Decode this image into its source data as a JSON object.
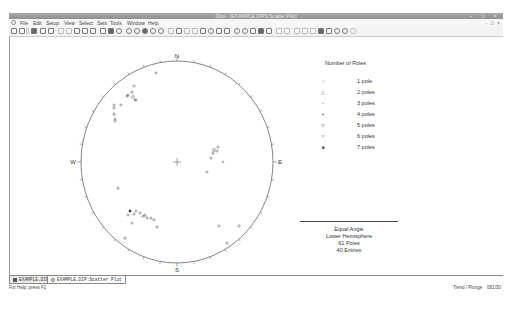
{
  "window": {
    "title": "Dips - [EXAMPLE.DIPS:Scatter Plot]",
    "controls": [
      "minimize",
      "maximize",
      "close"
    ]
  },
  "menubar": {
    "items": [
      "File",
      "Edit",
      "Setup",
      "View",
      "Select",
      "Sets",
      "Tools",
      "Window",
      "Help"
    ]
  },
  "toolbar": {
    "buttons": [
      "new-icon",
      "open-icon",
      "dropdown-icon",
      "save-icon",
      "print-preview-icon",
      "print-icon",
      "undo-icon",
      "redo-icon",
      "copy-icon",
      "paste-icon",
      "export-icon",
      "pole-plot-icon",
      "scatter-plot-icon",
      "contour-plot-icon",
      "stereonet-1-icon",
      "stereonet-2-icon",
      "stereonet-3-icon",
      "stereonet-4-icon",
      "stereonet-5-icon",
      "add-plane-icon",
      "add-set-icon",
      "add-line-icon",
      "edit-icon",
      "circle-icon",
      "cone-icon",
      "cone-2-icon",
      "set-window-icon",
      "intersection-icon",
      "kinematic-icon",
      "rosette-icon",
      "arrow-icon",
      "chart-icon",
      "filter-icon",
      "query-icon",
      "measure-icon",
      "grid-icon",
      "zoom-icon",
      "zoom-extents-icon",
      "rotate-icon",
      "pan-icon",
      "info-icon",
      "help-icon"
    ]
  },
  "plot": {
    "compass": {
      "north": "N",
      "south": "S",
      "east": "E",
      "west": "W"
    },
    "center_marker": "+"
  },
  "chart_data": {
    "type": "scatter",
    "projection": "Equal Angle",
    "hemisphere": "Lower Hemisphere",
    "legend_title": "Number of Poles",
    "legend": [
      {
        "label": "1 pole",
        "symbol": "○"
      },
      {
        "label": "2 poles",
        "symbol": "△"
      },
      {
        "label": "3 poles",
        "symbol": "▫"
      },
      {
        "label": "4 poles",
        "symbol": "+"
      },
      {
        "label": "5 poles",
        "symbol": "◇"
      },
      {
        "label": "6 poles",
        "symbol": "▿"
      },
      {
        "label": "7 poles",
        "symbol": "■"
      }
    ],
    "points_px": [
      [
        155,
        73,
        1
      ],
      [
        133,
        86,
        1
      ],
      [
        131,
        92,
        2
      ],
      [
        127,
        95,
        2
      ],
      [
        134,
        100,
        4
      ],
      [
        126,
        96,
        1
      ],
      [
        132,
        97,
        3
      ],
      [
        135,
        100,
        1
      ],
      [
        113,
        105,
        1
      ],
      [
        120,
        105,
        1
      ],
      [
        113,
        108,
        1
      ],
      [
        113,
        114,
        2
      ],
      [
        114,
        119,
        1
      ],
      [
        114,
        121,
        1
      ],
      [
        217,
        147,
        1
      ],
      [
        213,
        150,
        3
      ],
      [
        216,
        151,
        1
      ],
      [
        212,
        153,
        2
      ],
      [
        210,
        158,
        1
      ],
      [
        222,
        162,
        4
      ],
      [
        206,
        172,
        1
      ],
      [
        117,
        188,
        2
      ],
      [
        129,
        211,
        7
      ],
      [
        127,
        215,
        1
      ],
      [
        133,
        214,
        1
      ],
      [
        135,
        211,
        1
      ],
      [
        139,
        213,
        1
      ],
      [
        142,
        216,
        2
      ],
      [
        144,
        215,
        2
      ],
      [
        146,
        218,
        1
      ],
      [
        150,
        218,
        2
      ],
      [
        153,
        220,
        1
      ],
      [
        131,
        223,
        1
      ],
      [
        156,
        227,
        1
      ],
      [
        124,
        238,
        2
      ],
      [
        218,
        226,
        1
      ],
      [
        238,
        226,
        1
      ],
      [
        226,
        243,
        1
      ]
    ],
    "summary": {
      "projection": "Equal Angle",
      "hemisphere": "Lower Hemisphere",
      "poles": "61 Poles",
      "entries": "40 Entries"
    }
  },
  "tabs": [
    {
      "label": "EXAMPLE.DIP",
      "active": true
    },
    {
      "label": "EXAMPLE.DIP:Scatter Plot",
      "active": false
    }
  ],
  "statusbar": {
    "help_text": "For Help, press F1",
    "mode": "Trend / Plunge",
    "cursor_value": "081/30"
  }
}
